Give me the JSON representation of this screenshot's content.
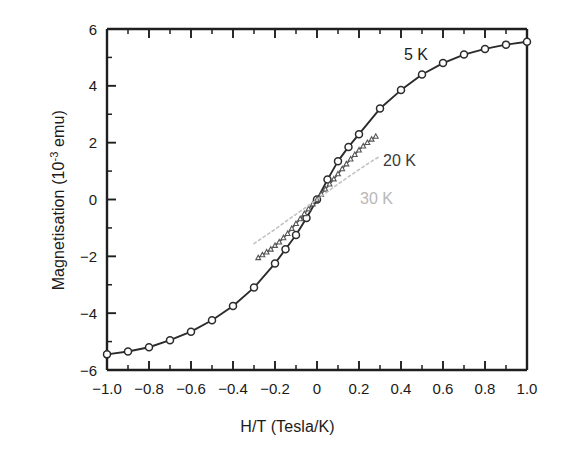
{
  "chart_data": {
    "type": "line",
    "title": "",
    "xlabel": "H/T (Tesla/K)",
    "ylabel": "Magnetisation (10-3 emu)",
    "ylabel_prefix": "Magnetisation (10",
    "ylabel_exponent": "-3",
    "ylabel_suffix": " emu)",
    "xlim": [
      -1.0,
      1.0
    ],
    "ylim": [
      -6,
      6
    ],
    "x_major_step": 0.2,
    "x_minor_step": 0.1,
    "y_major_step": 2,
    "y_minor_step": 1,
    "grid": false,
    "legend_position": "inline-annotations",
    "x_tick_labels": [
      "-1.0",
      "-0.8",
      "-0.6",
      "-0.4",
      "-0.2",
      "0",
      "0.2",
      "0.4",
      "0.6",
      "0.8",
      "1.0"
    ],
    "x_tick_values": [
      -1.0,
      -0.8,
      -0.6,
      -0.4,
      -0.2,
      0,
      0.2,
      0.4,
      0.6,
      0.8,
      1.0
    ],
    "y_tick_labels": [
      "6",
      "4",
      "2",
      "0",
      "-2",
      "-4",
      "-6"
    ],
    "y_tick_values": [
      6,
      4,
      2,
      0,
      -2,
      -4,
      -6
    ],
    "series": [
      {
        "name": "5 K",
        "label": "5 K",
        "color": "#2b2b2b",
        "marker": "open-circle",
        "marker_size": 7,
        "line_style": "solid",
        "x": [
          -1.0,
          -0.9,
          -0.8,
          -0.7,
          -0.6,
          -0.5,
          -0.4,
          -0.3,
          -0.2,
          -0.15,
          -0.1,
          -0.05,
          0,
          0.05,
          0.1,
          0.15,
          0.2,
          0.3,
          0.4,
          0.5,
          0.6,
          0.7,
          0.8,
          0.9,
          1.0
        ],
        "values": [
          -5.45,
          -5.35,
          -5.2,
          -4.95,
          -4.65,
          -4.25,
          -3.75,
          -3.1,
          -2.25,
          -1.75,
          -1.25,
          -0.65,
          0.0,
          0.7,
          1.35,
          1.85,
          2.3,
          3.2,
          3.85,
          4.4,
          4.8,
          5.1,
          5.3,
          5.45,
          5.55
        ]
      },
      {
        "name": "20 K",
        "label": "20 K",
        "color": "#555555",
        "marker": "open-triangle",
        "marker_size": 4,
        "line_style": "solid",
        "x": [
          -0.28,
          -0.26,
          -0.24,
          -0.22,
          -0.2,
          -0.18,
          -0.16,
          -0.14,
          -0.12,
          -0.1,
          -0.08,
          -0.06,
          -0.04,
          -0.02,
          0,
          0.02,
          0.04,
          0.06,
          0.08,
          0.1,
          0.12,
          0.14,
          0.16,
          0.18,
          0.2,
          0.22,
          0.24,
          0.26,
          0.28
        ],
        "values": [
          -2.05,
          -1.95,
          -1.85,
          -1.75,
          -1.62,
          -1.5,
          -1.35,
          -1.2,
          -1.02,
          -0.85,
          -0.68,
          -0.5,
          -0.33,
          -0.16,
          0.0,
          0.18,
          0.36,
          0.54,
          0.72,
          0.9,
          1.08,
          1.25,
          1.42,
          1.58,
          1.74,
          1.88,
          2.0,
          2.12,
          2.22
        ]
      },
      {
        "name": "30 K",
        "label": "30 K",
        "color": "#c2c2c2",
        "marker": "none",
        "marker_size": 0,
        "line_style": "dotted",
        "x": [
          -0.3,
          -0.25,
          -0.2,
          -0.15,
          -0.1,
          -0.05,
          0,
          0.05,
          0.1,
          0.15,
          0.2,
          0.25,
          0.3
        ],
        "values": [
          -1.55,
          -1.3,
          -1.05,
          -0.78,
          -0.52,
          -0.26,
          0.0,
          0.27,
          0.54,
          0.8,
          1.05,
          1.3,
          1.52
        ]
      }
    ],
    "annotations": [
      {
        "text": "5 K",
        "x": 0.38,
        "y": 5.0,
        "color": "#1c1c1c"
      },
      {
        "text": "20 K",
        "x": 0.3,
        "y": 2.1,
        "color": "#3a3a3a"
      },
      {
        "text": "30 K",
        "x": 0.22,
        "y": 0.75,
        "color": "#b8b8b8"
      }
    ]
  }
}
